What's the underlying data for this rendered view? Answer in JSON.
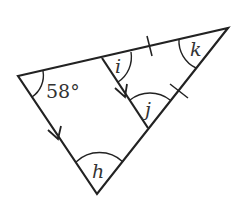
{
  "diagram": {
    "angles": {
      "given": "58°",
      "h": "h",
      "i": "i",
      "j": "j",
      "k": "k"
    },
    "colors": {
      "stroke": "#222222",
      "text": "#333333"
    }
  }
}
